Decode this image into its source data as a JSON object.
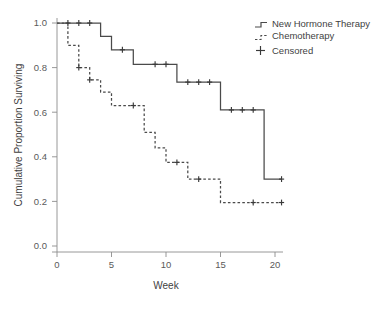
{
  "chart_data": {
    "type": "line",
    "title": "",
    "xlabel": "Week",
    "ylabel": "Cumulative Proportion Surviving",
    "xlim": [
      0,
      21
    ],
    "ylim": [
      0.0,
      1.05
    ],
    "xticks": [
      "0",
      "5",
      "10",
      "15",
      "20"
    ],
    "xtick_values": [
      0,
      5,
      10,
      15,
      20
    ],
    "yticks": [
      "0.0",
      "0.2",
      "0.4",
      "0.6",
      "0.8",
      "1.0"
    ],
    "ytick_values": [
      0.0,
      0.2,
      0.4,
      0.6,
      0.8,
      1.0
    ],
    "grid": false,
    "legend_position": "top-right",
    "line_color": "#4a4a4a",
    "axis_color": "#8d8d8d",
    "series": [
      {
        "name": "New Hormone Therapy",
        "style": "solid",
        "step": "post",
        "x": [
          0,
          4,
          5,
          7,
          11,
          15,
          19,
          20.6
        ],
        "y": [
          1.0,
          0.94,
          0.88,
          0.815,
          0.735,
          0.61,
          0.3,
          0.3
        ],
        "censored_x": [
          1,
          2,
          3,
          6,
          9,
          10,
          12,
          13,
          14,
          16,
          17,
          18,
          20.6
        ],
        "censored_y": [
          1.0,
          1.0,
          1.0,
          0.88,
          0.815,
          0.815,
          0.735,
          0.735,
          0.735,
          0.61,
          0.61,
          0.61,
          0.3
        ]
      },
      {
        "name": "Chemotherapy",
        "style": "dashed",
        "step": "post",
        "x": [
          0,
          1,
          2,
          3,
          4,
          5,
          8,
          9,
          10,
          12,
          15,
          20.6
        ],
        "y": [
          1.0,
          0.9,
          0.8,
          0.745,
          0.69,
          0.63,
          0.51,
          0.44,
          0.375,
          0.3,
          0.195,
          0.195
        ],
        "censored_x": [
          2,
          3,
          7,
          11,
          13,
          18,
          20.6
        ],
        "censored_y": [
          0.8,
          0.745,
          0.63,
          0.375,
          0.3,
          0.195,
          0.195
        ]
      }
    ],
    "legend": [
      {
        "label": "New Hormone Therapy",
        "marker": "step-line-solid"
      },
      {
        "label": "Chemotherapy",
        "marker": "step-line-dashed"
      },
      {
        "label": "Censored",
        "marker": "plus-marker"
      }
    ]
  }
}
